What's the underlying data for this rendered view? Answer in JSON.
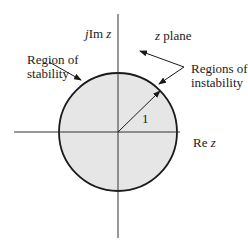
{
  "diagram": {
    "plane_label": {
      "prefix": "z",
      "suffix": " plane"
    },
    "imag_axis_label": {
      "prefix": "j",
      "main": "Im ",
      "var": "z"
    },
    "real_axis_label": {
      "main": "Re ",
      "var": "z"
    },
    "radius_label": "1",
    "stability_label": {
      "line1": "Region of",
      "line2": "stability"
    },
    "instability_label": {
      "line1": "Regions of",
      "line2": "instability"
    },
    "colors": {
      "fill": "#e6e6e6",
      "stroke": "#1a1a1a",
      "axis": "#333333",
      "background": "#ffffff"
    },
    "geometry": {
      "center_x": 118,
      "center_y": 132,
      "radius": 59
    }
  }
}
